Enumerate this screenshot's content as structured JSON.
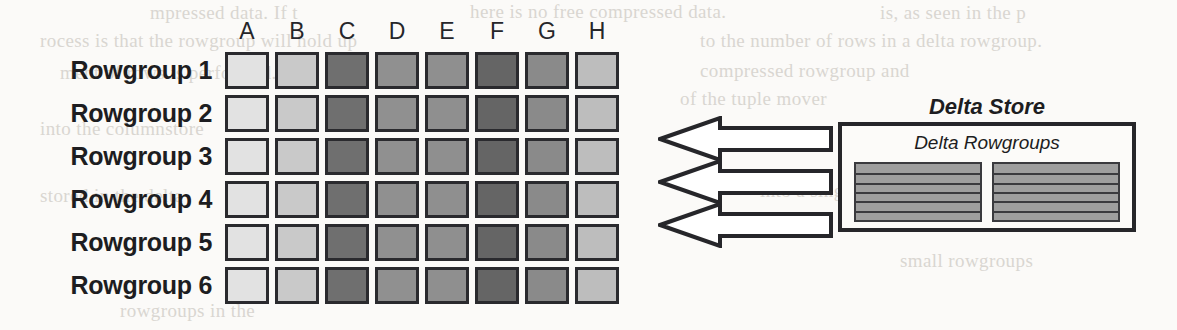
{
  "figure": {
    "width": 1177,
    "height": 330,
    "background": "#fbfaf8"
  },
  "grid": {
    "column_headers": [
      "A",
      "B",
      "C",
      "D",
      "E",
      "F",
      "G",
      "H"
    ],
    "row_labels": [
      "Rowgroup 1",
      "Rowgroup 2",
      "Rowgroup 3",
      "Rowgroup 4",
      "Rowgroup 5",
      "Rowgroup 6"
    ],
    "column_colors": [
      "#e2e2e2",
      "#c9c9c9",
      "#6f6f6f",
      "#909090",
      "#8f8f8f",
      "#656565",
      "#8a8a8a",
      "#bdbdbd"
    ],
    "cell_border_color": "#2a2a2e",
    "origin_x": 225,
    "origin_y": 52,
    "cell_width": 44,
    "cell_height": 37,
    "col_pitch": 50,
    "row_pitch": 43,
    "label_column_right": 212
  },
  "arrows": {
    "count": 3,
    "direction": "left",
    "fill": "#ffffff",
    "stroke": "#26262a",
    "items": [
      {
        "top": 116
      },
      {
        "top": 159
      },
      {
        "top": 202
      }
    ]
  },
  "delta_store": {
    "title": "Delta Store",
    "subtitle": "Delta Rowgroups",
    "block_fill": "#9e9e9e",
    "block_line_color": "#3a3a3e",
    "border_color": "#26262a",
    "blocks": [
      {
        "stripes": 6
      },
      {
        "stripes": 6
      }
    ]
  },
  "background_bleed": {
    "color": "#d9d6d1",
    "lines": [
      "mpressed data. If t",
      "here is no free compressed   data.",
      "is, as seen in the p",
      "rocess is that the rowgroup will hold up",
      "to the number of rows in a delta rowgroup.",
      "ment of rows is performed.",
      "compressed rowgroup and",
      "of the tuple mover",
      "into the columnstore",
      "small rowgroups",
      "rowgroups in the",
      "into a single larger",
      "stored in the delta"
    ]
  }
}
